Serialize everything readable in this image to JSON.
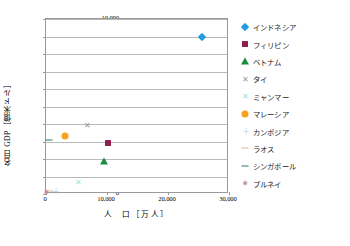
{
  "chart_data": {
    "type": "scatter",
    "title": "",
    "xlabel": "人　口［万人］",
    "ylabel": "名目 GDP［億米ドル］",
    "xlim": [
      0,
      30000
    ],
    "ylim": [
      0,
      10000
    ],
    "xticks": [
      "0",
      "10,000",
      "20,000",
      "30,000"
    ],
    "xtick_values": [
      0,
      10000,
      20000,
      30000
    ],
    "yticks": [
      "0",
      "1,000",
      "2,000",
      "3,000",
      "4,000",
      "5,000",
      "6,000",
      "7,000",
      "8,000",
      "9,000",
      "10,000"
    ],
    "ytick_values": [
      0,
      1000,
      2000,
      3000,
      4000,
      5000,
      6000,
      7000,
      8000,
      9000,
      10000
    ],
    "grid": "horizontal",
    "legend_position": "right",
    "series": [
      {
        "name": "インドネシア",
        "marker": "diamond",
        "color": "#1f9fe0",
        "x": 25500,
        "y": 8950
      },
      {
        "name": "フィリピン",
        "marker": "square",
        "color": "#8e1f4f",
        "x": 10150,
        "y": 2890
      },
      {
        "name": "ベトナム",
        "marker": "triangle",
        "color": "#1a8c3c",
        "x": 9450,
        "y": 1890
      },
      {
        "name": "タイ",
        "marker": "cross",
        "color": "#9a9a9a",
        "x": 6850,
        "y": 3960
      },
      {
        "name": "ミャンマー",
        "marker": "cross",
        "color": "#9fdede",
        "x": 5400,
        "y": 660
      },
      {
        "name": "マレーシア",
        "marker": "circle",
        "color": "#f5a21e",
        "x": 3180,
        "y": 3300
      },
      {
        "name": "カンボジア",
        "marker": "plus",
        "color": "#b9c6e8",
        "x": 1600,
        "y": 200
      },
      {
        "name": "ラオス",
        "marker": "dash",
        "color": "#e0b49a",
        "x": 700,
        "y": 170
      },
      {
        "name": "シンガポール",
        "marker": "dash",
        "color": "#1f7a6e",
        "x": 560,
        "y": 3100
      },
      {
        "name": "ブルネイ",
        "marker": "star",
        "color": "#c08a9a",
        "x": 43,
        "y": 140
      }
    ]
  },
  "colors": {
    "frame": "#9a9a9a",
    "grid": "#b9b9b9",
    "text": "#000000",
    "background": "#ffffff"
  }
}
